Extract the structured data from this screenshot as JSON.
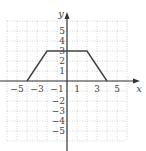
{
  "chart_data": {
    "type": "line",
    "title": "",
    "xlabel": "x",
    "ylabel": "y",
    "xlim": [
      -6,
      6
    ],
    "ylim": [
      -6,
      6
    ],
    "grid": true,
    "x_tick_labels": [
      "-5",
      "-3",
      "-1",
      "1",
      "3",
      "5"
    ],
    "y_tick_labels": [
      "5",
      "4",
      "3",
      "2",
      "1",
      "-2",
      "-3",
      "-4",
      "-5"
    ],
    "series": [
      {
        "name": "f(x)",
        "x": [
          -4,
          -2,
          2,
          4
        ],
        "y": [
          0,
          3,
          3,
          0
        ]
      }
    ],
    "colors": {
      "line": "#444444",
      "grid": "#bbbbbb",
      "axis": "#333333"
    }
  }
}
